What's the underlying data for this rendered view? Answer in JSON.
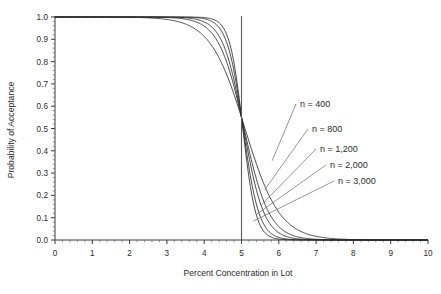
{
  "chart_data": {
    "type": "line",
    "title": "",
    "xlabel": "Percent Concentration in Lot",
    "ylabel": "Probability of Acceptance",
    "xlim": [
      0,
      10
    ],
    "ylim": [
      0,
      1.0
    ],
    "grid": false,
    "legend_position": "inline-annotations",
    "x_ticks": [
      "0",
      "1",
      "2",
      "3",
      "4",
      "5",
      "6",
      "7",
      "8",
      "9",
      "10"
    ],
    "x_tick_values": [
      0,
      1,
      2,
      3,
      4,
      5,
      6,
      7,
      8,
      9,
      10
    ],
    "y_ticks": [
      "0.0",
      "0.1",
      "0.2",
      "0.3",
      "0.4",
      "0.5",
      "0.6",
      "0.7",
      "0.8",
      "0.9",
      "1.0"
    ],
    "y_tick_values": [
      0.0,
      0.1,
      0.2,
      0.3,
      0.4,
      0.5,
      0.6,
      0.7,
      0.8,
      0.9,
      1.0
    ],
    "minor_ticks_per_interval": 4,
    "reference_line": {
      "name": "lot-limit-line",
      "x": 5,
      "label": ""
    },
    "crossing_point": {
      "x": 5.0,
      "y": 0.55
    },
    "series": [
      {
        "name": "n = 400",
        "n": 400,
        "steepness": 2.15,
        "x": [
          0.0,
          1.0,
          2.0,
          2.5,
          3.0,
          3.25,
          3.5,
          3.75,
          4.0,
          4.25,
          4.5,
          4.75,
          5.0,
          5.25,
          5.5,
          5.75,
          6.0,
          6.25,
          6.5,
          7.0,
          7.5,
          8.0,
          8.5,
          9.0,
          10.0
        ],
        "values": [
          1.0,
          1.0,
          1.0,
          0.999,
          0.995,
          0.989,
          0.975,
          0.947,
          0.896,
          0.818,
          0.715,
          0.598,
          0.55,
          0.398,
          0.295,
          0.207,
          0.138,
          0.088,
          0.054,
          0.019,
          0.006,
          0.002,
          0.001,
          0.0,
          0.0
        ]
      },
      {
        "name": "n = 800",
        "n": 800,
        "steepness": 2.95,
        "x": [
          0.0,
          1.0,
          2.0,
          2.5,
          3.0,
          3.25,
          3.5,
          3.75,
          4.0,
          4.25,
          4.5,
          4.75,
          5.0,
          5.25,
          5.5,
          5.75,
          6.0,
          6.25,
          6.5,
          7.0,
          7.5,
          8.0,
          8.5,
          9.0,
          10.0
        ],
        "values": [
          1.0,
          1.0,
          1.0,
          1.0,
          0.999,
          0.997,
          0.991,
          0.975,
          0.94,
          0.873,
          0.768,
          0.634,
          0.55,
          0.357,
          0.237,
          0.147,
          0.085,
          0.046,
          0.024,
          0.006,
          0.001,
          0.0,
          0.0,
          0.0,
          0.0
        ]
      },
      {
        "name": "n = 1,200",
        "n": 1200,
        "steepness": 3.6,
        "x": [
          0.0,
          1.0,
          2.0,
          2.5,
          3.0,
          3.25,
          3.5,
          3.75,
          4.0,
          4.25,
          4.5,
          4.75,
          5.0,
          5.25,
          5.5,
          5.75,
          6.0,
          6.25,
          6.5,
          7.0,
          7.5,
          8.0,
          8.5,
          9.0,
          10.0
        ],
        "values": [
          1.0,
          1.0,
          1.0,
          1.0,
          1.0,
          0.999,
          0.996,
          0.987,
          0.962,
          0.903,
          0.795,
          0.65,
          0.55,
          0.337,
          0.202,
          0.112,
          0.057,
          0.027,
          0.012,
          0.002,
          0.0,
          0.0,
          0.0,
          0.0,
          0.0
        ]
      },
      {
        "name": "n = 2,000",
        "n": 2000,
        "steepness": 4.65,
        "x": [
          0.0,
          1.0,
          2.0,
          2.5,
          3.0,
          3.25,
          3.5,
          3.75,
          4.0,
          4.25,
          4.5,
          4.75,
          5.0,
          5.25,
          5.5,
          5.75,
          6.0,
          6.25,
          6.5,
          7.0,
          7.5,
          8.0,
          8.5,
          9.0,
          10.0
        ],
        "values": [
          1.0,
          1.0,
          1.0,
          1.0,
          1.0,
          1.0,
          0.999,
          0.995,
          0.983,
          0.94,
          0.836,
          0.673,
          0.55,
          0.311,
          0.157,
          0.07,
          0.028,
          0.01,
          0.003,
          0.0,
          0.0,
          0.0,
          0.0,
          0.0,
          0.0
        ]
      },
      {
        "name": "n = 3,000",
        "n": 3000,
        "steepness": 5.7,
        "x": [
          0.0,
          1.0,
          2.0,
          2.5,
          3.0,
          3.25,
          3.5,
          3.75,
          4.0,
          4.25,
          4.5,
          4.75,
          5.0,
          5.25,
          5.5,
          5.75,
          6.0,
          6.25,
          6.5,
          7.0,
          7.5,
          8.0,
          8.5,
          9.0,
          10.0
        ],
        "values": [
          1.0,
          1.0,
          1.0,
          1.0,
          1.0,
          1.0,
          1.0,
          0.998,
          0.991,
          0.959,
          0.861,
          0.688,
          0.55,
          0.291,
          0.125,
          0.046,
          0.015,
          0.005,
          0.001,
          0.0,
          0.0,
          0.0,
          0.0,
          0.0,
          0.0
        ]
      }
    ],
    "annotations": [
      {
        "name": "n = 400",
        "label_x": 300,
        "label_y": 107,
        "anchor_x": 5.82,
        "anchor_y": 0.355
      },
      {
        "name": "n = 800",
        "label_x": 312,
        "label_y": 132,
        "anchor_x": 5.62,
        "anchor_y": 0.225
      },
      {
        "name": "n = 1,200",
        "label_x": 320,
        "label_y": 152,
        "anchor_x": 5.52,
        "anchor_y": 0.155
      },
      {
        "name": "n = 2,000",
        "label_x": 330,
        "label_y": 168,
        "anchor_x": 5.4,
        "anchor_y": 0.115
      },
      {
        "name": "n = 3,000",
        "label_x": 338,
        "label_y": 184,
        "anchor_x": 5.32,
        "anchor_y": 0.085
      }
    ],
    "colors": {
      "curve": "#2b2b2b",
      "axis": "#3a3a3a",
      "reference_line": "#5a5a5a",
      "leader": "#6b6b6b",
      "background": "#ffffff",
      "text": "#2a2a2a"
    }
  }
}
